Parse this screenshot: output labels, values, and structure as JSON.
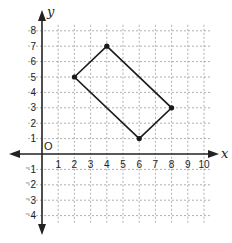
{
  "chart_data": {
    "type": "scatter",
    "title": "",
    "xlabel": "x",
    "ylabel": "y",
    "origin_label": "O",
    "xlim": [
      0,
      10
    ],
    "ylim": [
      -4,
      8
    ],
    "grid": true,
    "x_ticks": [
      1,
      2,
      3,
      4,
      5,
      6,
      7,
      8,
      9,
      10
    ],
    "y_ticks": [
      8,
      7,
      6,
      5,
      4,
      3,
      2,
      1,
      -1,
      -2,
      -3,
      -4
    ],
    "x_tick_labels": [
      "1",
      "2",
      "3",
      "4",
      "5",
      "6",
      "7",
      "8",
      "9",
      "10"
    ],
    "y_tick_labels": [
      "8",
      "7",
      "6",
      "5",
      "4",
      "3",
      "2",
      "1",
      "⁻1",
      "⁻2",
      "⁻3",
      "⁻4"
    ],
    "series": [
      {
        "name": "rectangle",
        "closed": true,
        "points": [
          {
            "x": 2,
            "y": 5
          },
          {
            "x": 4,
            "y": 7
          },
          {
            "x": 8,
            "y": 3
          },
          {
            "x": 6,
            "y": 1
          }
        ]
      }
    ],
    "colors": {
      "axis": "#222222",
      "grid": "#9a9a9a",
      "shape": "#1a1a1a"
    }
  }
}
